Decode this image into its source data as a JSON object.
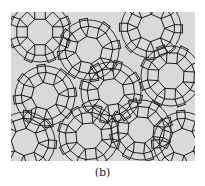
{
  "figure": {
    "caption": "(b)",
    "colors": {
      "background": "#d9d9d9",
      "lines": "#1e1e1e",
      "page": "#ffffff"
    },
    "tile_types": [
      "octagon",
      "square",
      "triangle",
      "rhomb"
    ],
    "ring_centers": [
      {
        "id": "ring-1",
        "label": "octagon-ring"
      },
      {
        "id": "ring-2",
        "label": "octagon-ring"
      },
      {
        "id": "ring-3",
        "label": "octagon-ring"
      },
      {
        "id": "ring-4",
        "label": "octagon-ring"
      },
      {
        "id": "ring-5",
        "label": "octagon-ring"
      },
      {
        "id": "ring-6",
        "label": "octagon-ring"
      },
      {
        "id": "ring-7",
        "label": "octagon-ring"
      },
      {
        "id": "ring-8",
        "label": "octagon-ring"
      },
      {
        "id": "ring-9",
        "label": "octagon-ring"
      },
      {
        "id": "ring-10",
        "label": "octagon-ring"
      }
    ]
  }
}
